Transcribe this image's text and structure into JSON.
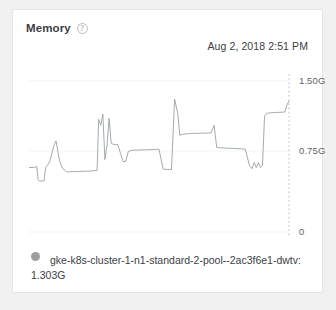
{
  "card": {
    "title": "Memory",
    "help_icon": "help-circle-icon",
    "timestamp": "Aug 2, 2018 2:51 PM"
  },
  "legend": {
    "swatch_color": "#9e9e9e",
    "series_label": "gke-k8s-cluster-1-n1-standard-2-pool--2ac3f6e1-dwtv:",
    "series_value": "1.303G"
  },
  "colors": {
    "line": "#9aa0a6",
    "grid": "#f1f3f4",
    "axis_text": "#5f6368",
    "card_bg": "#ffffff",
    "page_bg": "#f1f1f1"
  },
  "chart_data": {
    "type": "line",
    "title": "Memory",
    "xlabel": "",
    "ylabel": "",
    "ylim": [
      0,
      1.5
    ],
    "ytick_labels": [
      "1.50G",
      "0.75G",
      "0"
    ],
    "ytick_values": [
      1.5,
      0.75,
      0
    ],
    "grid": true,
    "legend_position": "bottom",
    "annotations": [
      {
        "type": "vertical-dashed-line",
        "label": "now",
        "x": 1.0
      }
    ],
    "series": [
      {
        "name": "gke-k8s-cluster-1-n1-standard-2-pool--2ac3f6e1-dwtv",
        "current_value": 1.303,
        "unit": "G",
        "x": [
          0.0,
          0.02,
          0.03,
          0.035,
          0.04,
          0.058,
          0.064,
          0.07,
          0.08,
          0.096,
          0.104,
          0.118,
          0.128,
          0.142,
          0.152,
          0.17,
          0.185,
          0.2,
          0.218,
          0.235,
          0.25,
          0.262,
          0.268,
          0.276,
          0.284,
          0.292,
          0.3,
          0.308,
          0.316,
          0.326,
          0.334,
          0.342,
          0.352,
          0.362,
          0.372,
          0.382,
          0.392,
          0.402,
          0.412,
          0.424,
          0.434,
          0.446,
          0.456,
          0.47,
          0.484,
          0.5,
          0.516,
          0.532,
          0.548,
          0.56,
          0.572,
          0.58,
          0.588,
          0.596,
          0.604,
          0.612,
          0.62,
          0.632,
          0.646,
          0.664,
          0.682,
          0.7,
          0.712,
          0.722,
          0.73,
          0.74,
          0.752,
          0.768,
          0.784,
          0.8,
          0.816,
          0.832,
          0.848,
          0.858,
          0.866,
          0.874,
          0.882,
          0.89,
          0.898,
          0.906,
          0.914,
          0.922,
          0.93,
          0.942,
          0.956,
          0.97,
          0.984,
          0.992,
          1.0
        ],
        "y": [
          0.64,
          0.642,
          0.65,
          0.52,
          0.505,
          0.508,
          0.64,
          0.66,
          0.7,
          0.86,
          0.905,
          0.7,
          0.64,
          0.6,
          0.598,
          0.6,
          0.6,
          0.602,
          0.604,
          0.606,
          0.608,
          0.612,
          1.12,
          1.06,
          1.17,
          0.72,
          0.86,
          1.13,
          0.88,
          0.87,
          0.868,
          0.866,
          0.78,
          0.7,
          0.7,
          0.8,
          0.81,
          0.812,
          0.814,
          0.814,
          0.816,
          0.816,
          0.818,
          0.818,
          0.82,
          0.822,
          0.624,
          0.622,
          0.62,
          1.32,
          1.18,
          0.96,
          0.97,
          0.972,
          0.974,
          0.976,
          0.978,
          0.98,
          0.98,
          0.982,
          0.982,
          0.984,
          1.06,
          0.84,
          0.838,
          0.836,
          0.834,
          0.832,
          0.83,
          0.828,
          0.826,
          0.824,
          0.66,
          0.63,
          0.69,
          0.64,
          0.69,
          0.64,
          0.66,
          1.15,
          1.18,
          1.182,
          1.184,
          1.186,
          1.188,
          1.19,
          1.192,
          1.26,
          1.303
        ]
      }
    ]
  }
}
